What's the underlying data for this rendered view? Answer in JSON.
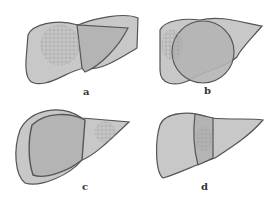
{
  "figure": {
    "panels": [
      {
        "id": "a",
        "label": "a",
        "description": "Liver outline with left-lateral/right region shaded; tumor in right lobe; resection line across middle"
      },
      {
        "id": "b",
        "label": "b",
        "description": "Liver with large central circular resection region"
      },
      {
        "id": "c",
        "label": "c",
        "description": "Liver with large right-lobe resection region outlined"
      },
      {
        "id": "d",
        "label": "d",
        "description": "Liver with narrow central segment containing tumor"
      }
    ],
    "colors": {
      "liver_fill": "#c8c8c8",
      "resect_fill": "#b4b4b4",
      "outline": "#555555",
      "tumor": "#9a9a9a"
    }
  }
}
